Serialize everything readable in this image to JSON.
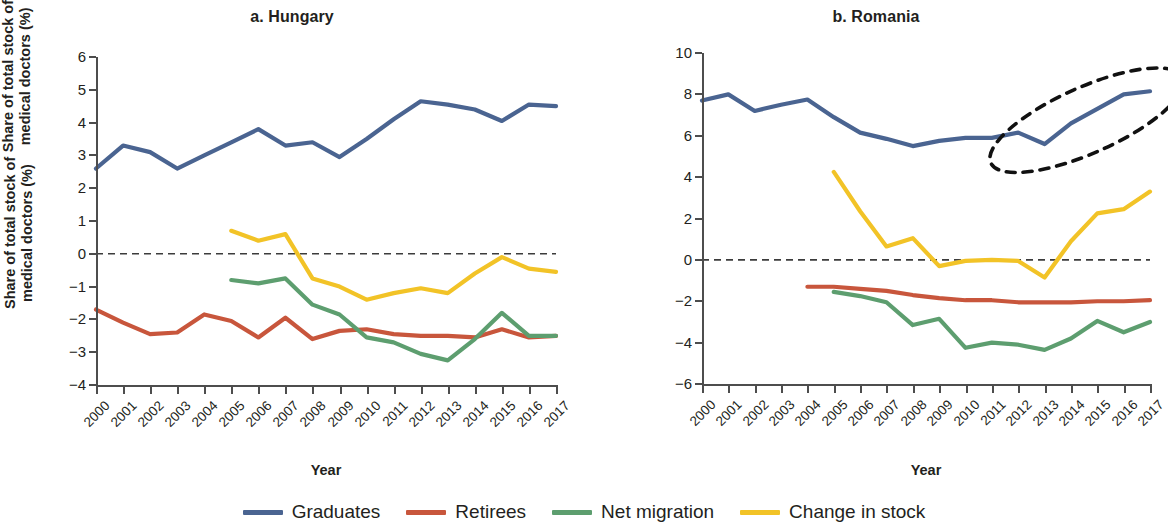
{
  "figure": {
    "y_axis_title": "Share of total stock of\nmedical doctors (%)",
    "x_axis_title": "Year"
  },
  "legend": {
    "items": [
      {
        "label": "Graduates",
        "color": "#4A6491"
      },
      {
        "label": "Retirees",
        "color": "#C8563C"
      },
      {
        "label": "Net migration",
        "color": "#5D9E6F"
      },
      {
        "label": "Change in stock",
        "color": "#F2C327"
      }
    ]
  },
  "panels": [
    {
      "id": "hungary",
      "title": "a. Hungary",
      "y_ticks": [
        "6",
        "5",
        "4",
        "3",
        "2",
        "1",
        "0",
        "-1",
        "-2",
        "-3",
        "-4"
      ],
      "x_ticks": [
        "2000",
        "2001",
        "2002",
        "2003",
        "2004",
        "2005",
        "2006",
        "2007",
        "2008",
        "2009",
        "2010",
        "2011",
        "2012",
        "2013",
        "2014",
        "2015",
        "2016",
        "2017"
      ]
    },
    {
      "id": "romania",
      "title": "b. Romania",
      "y_ticks": [
        "10",
        "8",
        "6",
        "4",
        "2",
        "0",
        "-2",
        "-4",
        "-6"
      ],
      "x_ticks": [
        "2000",
        "2001",
        "2002",
        "2003",
        "2004",
        "2005",
        "2006",
        "2007",
        "2008",
        "2009",
        "2010",
        "2011",
        "2012",
        "2013",
        "2014",
        "2015",
        "2016",
        "2017"
      ]
    }
  ],
  "annotations": [
    {
      "panel": "romania",
      "type": "dashed-ellipse",
      "name": "highlight-ellipse-graduates-2012-2017"
    }
  ],
  "chart_data": [
    {
      "type": "line",
      "title": "a. Hungary",
      "xlabel": "Year",
      "ylabel": "Share of total stock of medical doctors (%)",
      "x": [
        2000,
        2001,
        2002,
        2003,
        2004,
        2005,
        2006,
        2007,
        2008,
        2009,
        2010,
        2011,
        2012,
        2013,
        2014,
        2015,
        2016,
        2017
      ],
      "ylim": [
        -4,
        6
      ],
      "ytick_step": 1,
      "grid": false,
      "zero_line": true,
      "legend_position": "bottom",
      "series": [
        {
          "name": "Graduates",
          "color": "#4A6491",
          "x": [
            2000,
            2001,
            2002,
            2003,
            2004,
            2005,
            2006,
            2007,
            2008,
            2009,
            2010,
            2011,
            2012,
            2013,
            2014,
            2015,
            2016,
            2017
          ],
          "values": [
            2.6,
            3.3,
            3.1,
            2.6,
            3.0,
            3.4,
            3.8,
            3.3,
            3.4,
            2.95,
            3.5,
            4.1,
            4.65,
            4.55,
            4.4,
            4.05,
            4.55,
            4.5
          ]
        },
        {
          "name": "Retirees",
          "color": "#C8563C",
          "x": [
            2000,
            2001,
            2002,
            2003,
            2004,
            2005,
            2006,
            2007,
            2008,
            2009,
            2010,
            2011,
            2012,
            2013,
            2014,
            2015,
            2016,
            2017
          ],
          "values": [
            -1.7,
            -2.1,
            -2.45,
            -2.4,
            -1.85,
            -2.05,
            -2.55,
            -1.95,
            -2.6,
            -2.35,
            -2.3,
            -2.45,
            -2.5,
            -2.5,
            -2.55,
            -2.3,
            -2.55,
            -2.5
          ]
        },
        {
          "name": "Net migration",
          "color": "#5D9E6F",
          "x": [
            2005,
            2006,
            2007,
            2008,
            2009,
            2010,
            2011,
            2012,
            2013,
            2014,
            2015,
            2016,
            2017
          ],
          "values": [
            -0.8,
            -0.9,
            -0.75,
            -1.55,
            -1.85,
            -2.55,
            -2.7,
            -3.05,
            -3.25,
            -2.6,
            -1.8,
            -2.5,
            -2.5
          ]
        },
        {
          "name": "Change in stock",
          "color": "#F2C327",
          "x": [
            2005,
            2006,
            2007,
            2008,
            2009,
            2010,
            2011,
            2012,
            2013,
            2014,
            2015,
            2016,
            2017
          ],
          "values": [
            0.7,
            0.4,
            0.6,
            -0.75,
            -1.0,
            -1.4,
            -1.2,
            -1.05,
            -1.2,
            -0.6,
            -0.1,
            -0.45,
            -0.55
          ]
        }
      ]
    },
    {
      "type": "line",
      "title": "b. Romania",
      "xlabel": "Year",
      "ylabel": "Share of total stock of medical doctors (%)",
      "x": [
        2000,
        2001,
        2002,
        2003,
        2004,
        2005,
        2006,
        2007,
        2008,
        2009,
        2010,
        2011,
        2012,
        2013,
        2014,
        2015,
        2016,
        2017
      ],
      "ylim": [
        -6,
        10
      ],
      "ytick_step": 2,
      "grid": false,
      "zero_line": true,
      "legend_position": "bottom",
      "series": [
        {
          "name": "Graduates",
          "color": "#4A6491",
          "x": [
            2000,
            2001,
            2002,
            2003,
            2004,
            2005,
            2006,
            2007,
            2008,
            2009,
            2010,
            2011,
            2012,
            2013,
            2014,
            2015,
            2016,
            2017
          ],
          "values": [
            7.7,
            8.0,
            7.2,
            7.5,
            7.75,
            6.9,
            6.15,
            5.85,
            5.5,
            5.75,
            5.9,
            5.9,
            6.15,
            5.6,
            6.6,
            7.3,
            8.0,
            8.15
          ]
        },
        {
          "name": "Retirees",
          "color": "#C8563C",
          "x": [
            2004,
            2005,
            2006,
            2007,
            2008,
            2009,
            2010,
            2011,
            2012,
            2013,
            2014,
            2015,
            2016,
            2017
          ],
          "values": [
            -1.3,
            -1.3,
            -1.4,
            -1.5,
            -1.7,
            -1.85,
            -1.95,
            -1.95,
            -2.05,
            -2.05,
            -2.05,
            -2.0,
            -2.0,
            -1.95
          ]
        },
        {
          "name": "Net migration",
          "color": "#5D9E6F",
          "x": [
            2005,
            2006,
            2007,
            2008,
            2009,
            2010,
            2011,
            2012,
            2013,
            2014,
            2015,
            2016,
            2017
          ],
          "values": [
            -1.55,
            -1.75,
            -2.05,
            -3.15,
            -2.85,
            -4.25,
            -4.0,
            -4.1,
            -4.35,
            -3.8,
            -2.95,
            -3.5,
            -3.0
          ]
        },
        {
          "name": "Change in stock",
          "color": "#F2C327",
          "x": [
            2005,
            2006,
            2007,
            2008,
            2009,
            2010,
            2011,
            2012,
            2013,
            2014,
            2015,
            2016,
            2017
          ],
          "values": [
            4.25,
            2.35,
            0.65,
            1.05,
            -0.3,
            -0.05,
            0.0,
            -0.05,
            -0.85,
            0.9,
            2.25,
            2.45,
            3.3
          ]
        }
      ]
    }
  ]
}
